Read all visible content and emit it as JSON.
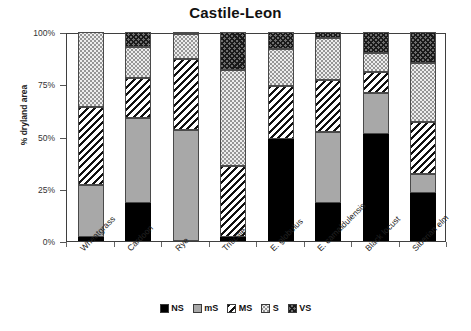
{
  "chart_data": {
    "type": "bar",
    "subtype": "stacked-100-percent",
    "title": "Castile-Leon",
    "xlabel": "",
    "ylabel": "% dryland area",
    "ylim": [
      0,
      100
    ],
    "yticks": [
      "0%",
      "25%",
      "50%",
      "75%",
      "100%"
    ],
    "ytick_values": [
      0,
      25,
      50,
      75,
      100
    ],
    "grid": false,
    "legend_position": "bottom",
    "categories": [
      "Wheatgrass",
      "Cardoon",
      "Rye",
      "Triticale",
      "E. globulus",
      "E. camaldulensis",
      "Black locust",
      "Siberian elm"
    ],
    "series": [
      {
        "name": "NS",
        "values": [
          2,
          18,
          0,
          2,
          49,
          18,
          51,
          23
        ]
      },
      {
        "name": "mS",
        "values": [
          25,
          41,
          53,
          0,
          0,
          34,
          20,
          9
        ]
      },
      {
        "name": "MS",
        "values": [
          37,
          19,
          34,
          34,
          25,
          25,
          10,
          25
        ]
      },
      {
        "name": "S",
        "values": [
          36,
          15,
          12,
          46,
          18,
          20,
          9,
          28
        ]
      },
      {
        "name": "VS",
        "values": [
          0,
          7,
          1,
          18,
          8,
          3,
          10,
          15
        ]
      }
    ]
  },
  "legend": {
    "items": [
      {
        "label": "NS",
        "pattern": "solid-black"
      },
      {
        "label": "mS",
        "pattern": "solid-gray"
      },
      {
        "label": "MS",
        "pattern": "diagonal-hatch"
      },
      {
        "label": "S",
        "pattern": "light-dotted"
      },
      {
        "label": "VS",
        "pattern": "cross-hatch"
      }
    ]
  }
}
